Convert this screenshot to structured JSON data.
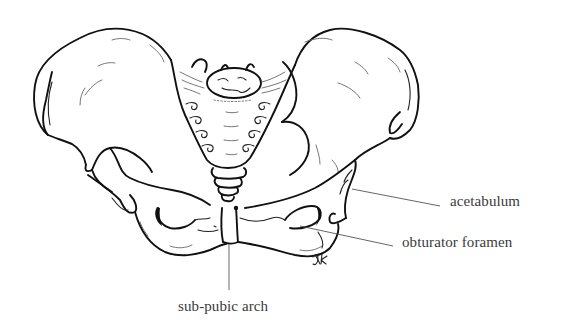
{
  "figure": {
    "style": "black ink line drawing",
    "signature": "JK"
  },
  "labels": {
    "acetabulum": "acetabulum",
    "obturator_foramen": "obturator foramen",
    "sub_pubic_arch": "sub-pubic arch"
  },
  "colors": {
    "background": "#ffffff",
    "ink": "#111111",
    "label_text": "#3a3a3a",
    "leader_line": "#555555"
  }
}
